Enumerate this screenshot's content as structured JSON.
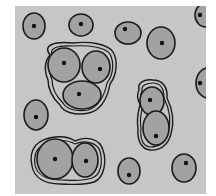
{
  "figure": {
    "colors": {
      "page": "#ffffff",
      "background": "#c6c6c6",
      "cell_fill": "#a2a2a2",
      "outline": "#1a1a1a",
      "nucleus": "#111111"
    },
    "frame": {
      "x": 15,
      "y": 6,
      "w": 191,
      "h": 188
    },
    "single_cells": [
      {
        "id": "cell-1",
        "cx": 34,
        "cy": 26,
        "rx": 11,
        "ry": 13,
        "nx": 34,
        "ny": 26
      },
      {
        "id": "cell-2",
        "cx": 81,
        "cy": 25,
        "rx": 12,
        "ry": 11,
        "nx": 81,
        "ny": 24
      },
      {
        "id": "cell-3",
        "cx": 128,
        "cy": 33,
        "rx": 13,
        "ry": 11,
        "nx": 125,
        "ny": 29
      },
      {
        "id": "cell-4",
        "cx": 161,
        "cy": 43,
        "rx": 14,
        "ry": 16,
        "nx": 162,
        "ny": 43
      },
      {
        "id": "cell-5",
        "cx": 206,
        "cy": 15,
        "rx": 11,
        "ry": 12,
        "nx": 200,
        "ny": 15
      },
      {
        "id": "cell-6",
        "cx": 208,
        "cy": 83,
        "rx": 12,
        "ry": 15,
        "nx": 200,
        "ny": 83
      },
      {
        "id": "cell-7",
        "cx": 36,
        "cy": 115,
        "rx": 12,
        "ry": 15,
        "nx": 36,
        "ny": 117
      },
      {
        "id": "cell-8",
        "cx": 129,
        "cy": 171,
        "rx": 11,
        "ry": 13,
        "nx": 129,
        "ny": 175
      },
      {
        "id": "cell-9",
        "cx": 184,
        "cy": 168,
        "rx": 12,
        "ry": 14,
        "nx": 186,
        "ny": 163
      }
    ],
    "clusters": [
      {
        "id": "cluster-triple",
        "outer_path": "M50,55 C42,45 55,41 73,43 C90,41 108,44 113,52 C118,60 117,75 110,84 C108,96 102,110 89,113 C75,116 63,112 60,105 C52,98 48,88 48,80 C44,70 44,62 50,55 Z",
        "inner_path": "M53,57 C47,48 58,45 73,46 C88,45 105,47 110,54 C114,62 114,74 107,83 C105,94 99,107 88,110 C76,112 66,109 63,103 C56,96 52,87 52,80 C48,70 48,63 53,57 Z",
        "cells": [
          {
            "cx": 64,
            "cy": 65,
            "rx": 16,
            "ry": 17,
            "nx": 64,
            "ny": 63
          },
          {
            "cx": 96,
            "cy": 67,
            "rx": 14,
            "ry": 16,
            "nx": 100,
            "ny": 69
          },
          {
            "cx": 82,
            "cy": 95,
            "rx": 19,
            "ry": 14,
            "nx": 79,
            "ny": 94
          }
        ]
      },
      {
        "id": "cluster-vertical-pair",
        "outer_path": "M139,90 C137,82 145,79 153,80 C163,80 168,88 167,98 C172,108 175,120 171,134 C168,145 160,151 150,150 C141,149 137,140 138,128 C136,118 139,110 140,104 C137,99 137,94 139,90 Z",
        "inner_path": "M142,91 C141,85 147,83 153,83 C161,83 164,89 164,98 C169,108 172,120 168,133 C165,143 158,147 150,147 C143,146 140,139 141,128 C139,118 142,110 143,104 C140,99 140,95 142,91 Z",
        "cells": [
          {
            "cx": 152,
            "cy": 101,
            "rx": 12,
            "ry": 14,
            "nx": 150,
            "ny": 100
          },
          {
            "cx": 156,
            "cy": 128,
            "rx": 13,
            "ry": 17,
            "nx": 156,
            "ny": 136
          }
        ]
      },
      {
        "id": "cluster-horizontal-pair",
        "outer_path": "M36,145 C45,136 65,134 75,141 C85,136 100,138 103,150 C107,162 104,178 94,182 C82,186 68,184 60,184 C45,184 34,178 32,166 C30,158 31,151 36,145 Z",
        "inner_path": "M39,148 C47,140 65,138 75,144 C84,140 97,142 100,151 C103,162 101,175 92,178 C81,182 68,180 61,180 C47,180 37,175 35,165 C34,158 35,152 39,148 Z",
        "cells": [
          {
            "cx": 55,
            "cy": 159,
            "rx": 18,
            "ry": 20,
            "nx": 55,
            "ny": 159
          },
          {
            "cx": 85,
            "cy": 160,
            "rx": 13,
            "ry": 17,
            "nx": 86,
            "ny": 161
          }
        ]
      }
    ]
  }
}
